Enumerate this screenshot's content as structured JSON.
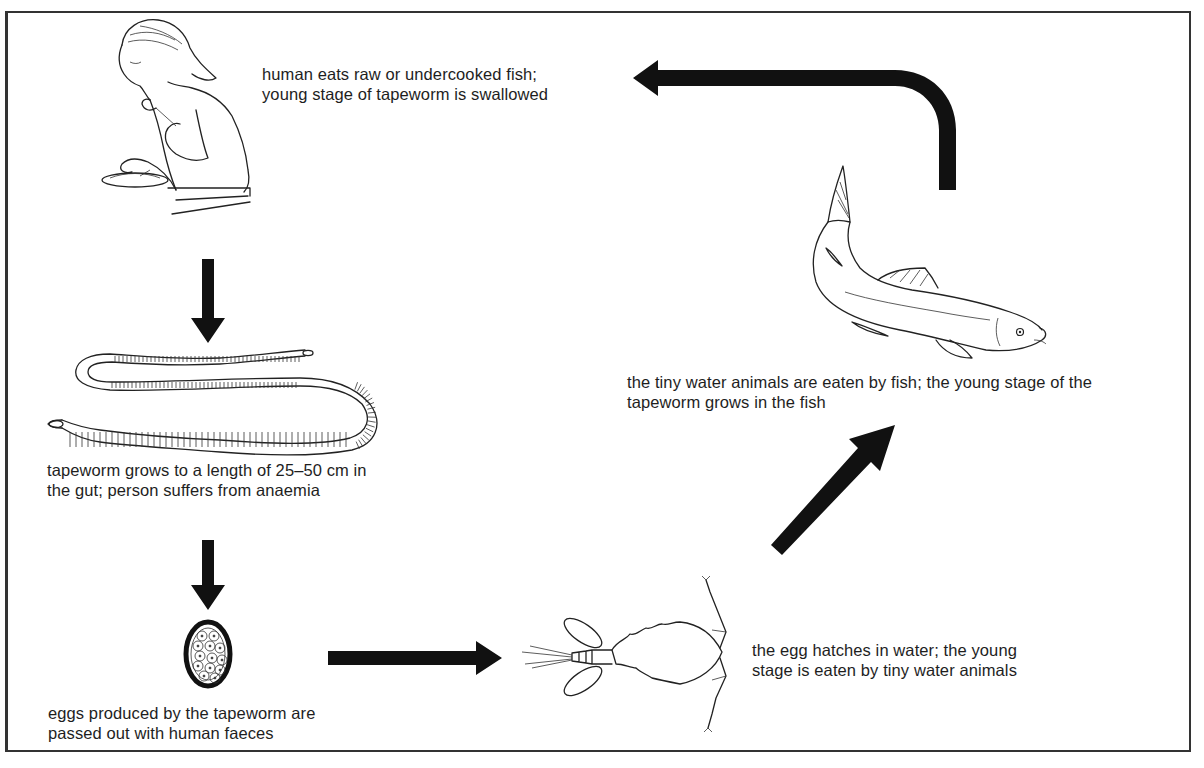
{
  "diagram": {
    "colors": {
      "ink": "#111111",
      "background": "#ffffff",
      "frame": "#333333"
    },
    "stages": [
      {
        "id": "human",
        "illustration": "person-eating-fish",
        "lines": [
          "human eats raw or undercooked fish;",
          "young stage of tapeworm is swallowed"
        ]
      },
      {
        "id": "tapeworm",
        "illustration": "adult-tapeworm",
        "lines": [
          "tapeworm grows to a length of 25–50 cm in",
          "the gut; person suffers from anaemia"
        ]
      },
      {
        "id": "egg",
        "illustration": "tapeworm-egg",
        "lines": [
          "eggs produced by the tapeworm are",
          "passed out with human faeces"
        ]
      },
      {
        "id": "water-animal",
        "illustration": "copepod",
        "lines": [
          "the egg hatches in water; the young",
          "stage is eaten by tiny water animals"
        ]
      },
      {
        "id": "fish",
        "illustration": "fish",
        "lines": [
          "the tiny water animals are eaten by fish; the young stage of the",
          "tapeworm grows in the fish"
        ]
      }
    ],
    "arrows": [
      {
        "from": "human",
        "to": "tapeworm",
        "direction": "down"
      },
      {
        "from": "tapeworm",
        "to": "egg",
        "direction": "down"
      },
      {
        "from": "egg",
        "to": "water-animal",
        "direction": "right"
      },
      {
        "from": "water-animal",
        "to": "fish",
        "direction": "up-right"
      },
      {
        "from": "fish",
        "to": "human",
        "direction": "up-then-left"
      }
    ]
  }
}
